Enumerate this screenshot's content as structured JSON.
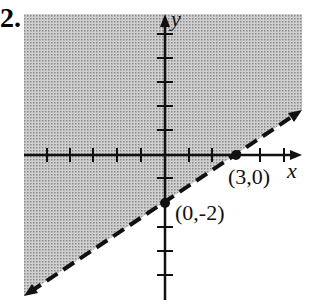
{
  "problem": {
    "number": "2."
  },
  "graph": {
    "x_axis_label": "x",
    "y_axis_label": "y",
    "points": [
      {
        "label": "(3,0)",
        "x": 3,
        "y": 0
      },
      {
        "label": "(0,-2)",
        "x": 0,
        "y": -2
      }
    ],
    "boundary_line": {
      "style": "dashed",
      "equation": "y = (2/3)x - 2"
    },
    "shaded_region": "above boundary line",
    "colors": {
      "shade": "#b8b8b8",
      "ink": "#111111"
    }
  }
}
